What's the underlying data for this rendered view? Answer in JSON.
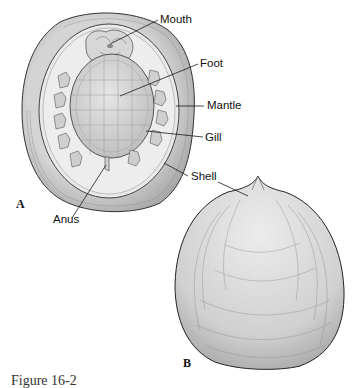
{
  "figure": {
    "panels": [
      {
        "id": "A",
        "label": "A",
        "description": "Ventral view of chiton-like mollusc (monoplacophoran) showing foot, mouth, gills, mantle and shell"
      },
      {
        "id": "B",
        "label": "B",
        "description": "Dorsal view of conical shell"
      }
    ],
    "labels": {
      "mouth": "Mouth",
      "foot": "Foot",
      "mantle": "Mantle",
      "gill": "Gill",
      "shell": "Shell",
      "anus": "Anus"
    },
    "caption": "Figure 16-2",
    "colors": {
      "line": "#1a1a1a",
      "shell_outer": "#bdbdbd",
      "shell_inner": "#dcdcdc",
      "mantle": "#e8e8e8",
      "foot": "#d2d2d2",
      "shell_b": "#d9d9d9"
    }
  }
}
